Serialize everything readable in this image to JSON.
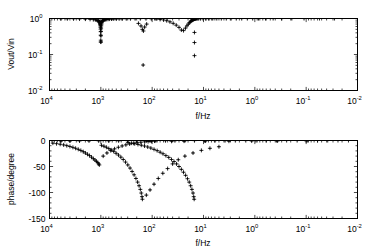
{
  "figure": {
    "background": "#ffffff",
    "foreground": "#000000",
    "marker_color": "#000000",
    "marker": "plus-cross",
    "width": 379,
    "height": 251
  },
  "chart_data": [
    {
      "type": "scatter",
      "id": "magnitude-plot",
      "title": "",
      "xlabel": "f/Hz",
      "ylabel": "Vout/Vin",
      "xscale": "log",
      "yscale": "log",
      "x_reversed": true,
      "xlim": [
        10000,
        0.01
      ],
      "ylim": [
        0.01,
        1.0
      ],
      "grid": false,
      "legend": null,
      "xticks": [
        10000,
        1000,
        100,
        10,
        1,
        0.1,
        0.01
      ],
      "xticklabels": [
        "10^4",
        "10^3",
        "10^2",
        "10^1",
        "10^0",
        "10^-1",
        "10^-2"
      ],
      "xtick_bases": [
        "10",
        "10",
        "10",
        "10",
        "10",
        "10",
        "10"
      ],
      "xtick_exponents": [
        "4",
        "3",
        "2",
        "1",
        "0",
        "-1",
        "-2"
      ],
      "yticks": [
        1,
        0.1,
        0.01
      ],
      "yticklabels": [
        "10^0",
        "10^-1",
        "10^-2"
      ],
      "ytick_bases": [
        "10",
        "10",
        "10"
      ],
      "ytick_exponents": [
        "0",
        "-1",
        "-2"
      ],
      "series": [
        {
          "name": "Vout/Vin magnitude",
          "marker": "plus-cross",
          "x": [
            6000,
            4500,
            3400,
            2600,
            2000,
            1620,
            1400,
            1280,
            1200,
            1150,
            1120,
            1095,
            1075,
            1060,
            1048,
            1038,
            1030,
            1022,
            1016,
            1011,
            1007,
            1004,
            1001,
            999,
            996,
            992,
            988,
            982,
            975,
            966,
            955,
            940,
            922,
            900,
            875,
            845,
            810,
            770,
            725,
            675,
            620,
            560,
            500,
            440,
            380,
            320,
            265,
            215,
            170,
            132,
            104,
            84,
            70,
            60,
            52,
            45,
            39,
            34,
            30,
            27,
            24.5,
            22.5,
            21,
            19.8,
            18.8,
            18.0,
            17.4,
            16.9,
            16.5,
            16.2,
            15.9,
            15.7,
            15.5,
            15.35,
            15.2,
            15.1,
            15.0,
            14.9,
            14.8,
            14.7,
            14.5,
            14.2,
            13.8,
            13.2,
            12.4,
            11.4,
            10.2,
            9.0,
            7.8,
            6.6,
            5.5,
            4.5,
            3.6,
            2.9,
            2.3,
            1.8,
            1.4,
            1.1,
            0.85,
            0.62,
            0.44,
            0.3,
            0.19,
            0.11,
            0.055,
            0.028
          ],
          "y": [
            0.985,
            0.982,
            0.978,
            0.972,
            0.962,
            0.948,
            0.932,
            0.918,
            0.902,
            0.884,
            0.866,
            0.845,
            0.82,
            0.792,
            0.76,
            0.722,
            0.68,
            0.63,
            0.572,
            0.505,
            0.43,
            0.345,
            0.25,
            0.222,
            0.33,
            0.44,
            0.54,
            0.625,
            0.695,
            0.752,
            0.798,
            0.836,
            0.866,
            0.89,
            0.91,
            0.926,
            0.938,
            0.948,
            0.956,
            0.963,
            0.968,
            0.972,
            0.976,
            0.979,
            0.982,
            0.984,
            0.986,
            0.988,
            0.989,
            0.988,
            0.982,
            0.968,
            0.945,
            0.912,
            0.866,
            0.806,
            0.735,
            0.655,
            0.568,
            0.478,
            0.461,
            0.54,
            0.625,
            0.7,
            0.762,
            0.812,
            0.852,
            0.882,
            0.906,
            0.924,
            0.938,
            0.949,
            0.957,
            0.963,
            0.968,
            0.972,
            0.975,
            0.978,
            0.98,
            0.982,
            0.984,
            0.986,
            0.987,
            0.988,
            0.989,
            0.99,
            0.991,
            0.991,
            0.992,
            0.992,
            0.993,
            0.993,
            0.994,
            0.994,
            0.995,
            0.995,
            0.996,
            0.996,
            0.997,
            0.997,
            0.998,
            0.998,
            0.999,
            0.999,
            1.0,
            1.0
          ]
        },
        {
          "name": "notch-minima",
          "marker": "plus-cross",
          "x": [
            1000,
            150,
            15.0,
            15.0,
            15.0
          ],
          "y": [
            0.222,
            0.051,
            0.41,
            0.215,
            0.093
          ]
        },
        {
          "name": "notch-2-shoulder",
          "marker": "plus-cross",
          "x": [
            185,
            165,
            155,
            148,
            140,
            128
          ],
          "y": [
            0.73,
            0.62,
            0.5,
            0.45,
            0.58,
            0.7
          ]
        }
      ]
    },
    {
      "type": "scatter",
      "id": "phase-plot",
      "title": "",
      "xlabel": "f/Hz",
      "ylabel": "phase/degree",
      "xscale": "log",
      "yscale": "linear",
      "x_reversed": true,
      "xlim": [
        10000,
        0.01
      ],
      "ylim": [
        -150,
        0
      ],
      "grid": false,
      "legend": null,
      "xticks": [
        10000,
        1000,
        100,
        10,
        1,
        0.1,
        0.01
      ],
      "xticklabels": [
        "10^4",
        "10^3",
        "10^2",
        "10^1",
        "10^0",
        "10^-1",
        "10^-2"
      ],
      "xtick_bases": [
        "10",
        "10",
        "10",
        "10",
        "10",
        "10",
        "10"
      ],
      "xtick_exponents": [
        "4",
        "3",
        "2",
        "1",
        "0",
        "-1",
        "-2"
      ],
      "yticks": [
        0,
        -50,
        -100,
        -150
      ],
      "yticklabels": [
        "0",
        "-50",
        "-100",
        "-150"
      ],
      "series": [
        {
          "name": "phase-branch-1",
          "marker": "plus-cross",
          "x": [
            1070,
            1100,
            1150,
            1220,
            1300,
            1400,
            1520,
            1660,
            1820,
            2000,
            2200,
            2450,
            2750,
            3100,
            3500,
            4000,
            4600,
            5300,
            6200,
            7300,
            8600
          ],
          "y": [
            -47,
            -45,
            -42.5,
            -40,
            -37.5,
            -35,
            -32,
            -29,
            -26.5,
            -24,
            -21.5,
            -19.2,
            -17.0,
            -15.0,
            -13.2,
            -11.5,
            -9.9,
            -8.5,
            -7.2,
            -6.1,
            -5.1
          ]
        },
        {
          "name": "phase-branch-1-upper",
          "marker": "plus-cross",
          "x": [
            900,
            760,
            640,
            540,
            455,
            385,
            325,
            275,
            232,
            196,
            166,
            140,
            120,
            103,
            90
          ],
          "y": [
            -30,
            -24,
            -19.5,
            -16,
            -13,
            -10.5,
            -8.4,
            -6.7,
            -5.3,
            -4.2,
            -3.3,
            -2.6,
            -2.0,
            -1.5,
            -1.1
          ]
        },
        {
          "name": "phase-branch-2",
          "marker": "plus-cross",
          "x": [
            155,
            158,
            163,
            170,
            180,
            192,
            207,
            225,
            246,
            270,
            298,
            330,
            366,
            407,
            453,
            505,
            563,
            628,
            700,
            780,
            870,
            970
          ],
          "y": [
            -113,
            -108,
            -101,
            -94,
            -87,
            -80,
            -73,
            -66,
            -59.5,
            -53,
            -47,
            -41.5,
            -36.5,
            -32,
            -28,
            -24.5,
            -21,
            -18,
            -15.5,
            -13,
            -11,
            -9.2
          ]
        },
        {
          "name": "phase-branch-2-right",
          "marker": "plus-cross",
          "x": [
            130,
            110,
            92,
            76,
            62,
            50,
            40,
            31,
            23,
            16,
            11,
            7.5,
            5.0
          ],
          "y": [
            -105,
            -95,
            -84,
            -73,
            -63,
            -54,
            -45,
            -37,
            -30,
            -24,
            -19,
            -15,
            -12
          ]
        },
        {
          "name": "phase-branch-3",
          "marker": "plus-cross",
          "x": [
            15.2,
            15.5,
            16.0,
            16.8,
            17.8,
            19.0,
            20.5,
            22.3,
            24.5,
            27.0,
            30.0,
            33.5,
            37.5,
            42.0,
            47.5,
            54.0,
            61.5,
            70.0,
            80.0,
            92.0,
            106,
            122,
            141,
            163,
            189,
            219,
            254,
            295
          ],
          "y": [
            -113,
            -108,
            -101,
            -94,
            -87,
            -80,
            -73.5,
            -67,
            -61,
            -55.5,
            -50,
            -45,
            -40.5,
            -36.5,
            -32.5,
            -29,
            -25.5,
            -22.5,
            -19.5,
            -17,
            -14.5,
            -12.5,
            -10.6,
            -9.0,
            -7.5,
            -6.2,
            -5.1,
            -4.1
          ]
        },
        {
          "name": "phase-baseline",
          "marker": "plus-cross",
          "x": [
            6000,
            4000,
            2600,
            1700,
            1100,
            700,
            450,
            300,
            200,
            130,
            85,
            55,
            36,
            23,
            15,
            9.5,
            6.0,
            3.8,
            2.4,
            1.5,
            0.95,
            0.6,
            0.38,
            0.24,
            0.15,
            0.095,
            0.06,
            0.038,
            0.024,
            0.015
          ],
          "y": [
            -1.2,
            -1.0,
            -0.9,
            -0.8,
            -0.7,
            -0.7,
            -0.6,
            -0.6,
            -0.5,
            -0.5,
            -0.5,
            -0.4,
            -0.4,
            -0.4,
            -0.3,
            -0.3,
            -0.3,
            -0.2,
            -0.2,
            -0.2,
            -0.2,
            -0.1,
            -0.1,
            -0.1,
            -0.1,
            0.0,
            0.0,
            0.0,
            0.0,
            0.0
          ]
        },
        {
          "name": "phase-sparse-markers",
          "marker": "plus-cross",
          "x": [
            110,
            42,
            24,
            9.2,
            3.2,
            1.15,
            0.36,
            0.1
          ],
          "y": [
            -1.0,
            -1.5,
            -1.2,
            -1.0,
            -1.3,
            -1.0,
            -0.8,
            -0.6
          ]
        }
      ]
    }
  ]
}
